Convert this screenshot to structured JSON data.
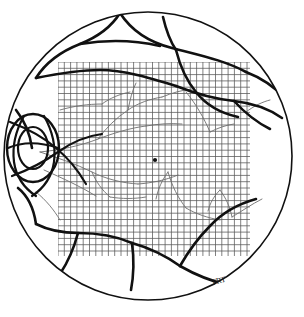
{
  "figure": {
    "background_color": "#ffffff",
    "ink_color": "#111111",
    "grid_color": "#555555",
    "fine_vessel_color": "#6e6e6e",
    "width": 304,
    "height": 317
  },
  "fundus_circle": {
    "label": "fundus-outline",
    "center_x": 148,
    "center_y": 156,
    "radius": 144,
    "stroke_width": 1.6
  },
  "optic_disc": {
    "label": "optic-disc",
    "center_x": 33,
    "center_y": 148,
    "radius_x": 26,
    "radius_y": 34,
    "inner_radius_x": 15,
    "inner_radius_y": 21
  },
  "fovea_marker": {
    "label": "fovea-center-dot",
    "x": 155,
    "y": 160,
    "radius": 2.1
  },
  "grid": {
    "label": "macular-grid",
    "left": 58,
    "top": 62,
    "right": 250,
    "bottom": 256,
    "cell_size": 6.3,
    "columns": 30,
    "rows": 31,
    "line_width": 0.75,
    "color": "#555555"
  },
  "signature": {
    "label": "artist-initials",
    "text": "TRT",
    "x": 212,
    "y": 285,
    "rotation": -14
  },
  "annotations": {
    "thick_vessel_count": 18,
    "fine_vessel_count": 22,
    "note": "Hand-drawn retinal fundus chart; heavy ink lines denote major retinal vessels and lesion borders, light gray lines denote fine vessel branches, square grid marks the posterior pole."
  },
  "vessels_thick": [
    "M 120 13 C 112 26 100 36 80 44 C 62 51 46 62 36 78",
    "M 120 13 C 131 30 148 42 172 48 C 198 55 224 60 246 72",
    "M 163 17 C 166 30 170 41 176 50",
    "M 80 44 C 104 40 134 40 160 46",
    "M 36 78 C 56 74 78 70 100 70 C 124 70 150 78 176 86",
    "M 176 50 C 180 66 186 80 196 92 C 206 105 220 113 238 117",
    "M 176 86 C 194 93 214 99 234 101 C 252 103 268 108 282 118",
    "M 246 72 C 262 78 276 88 287 100",
    "M 234 101 C 244 112 256 122 270 129",
    "M 16 110 C 24 120 30 134 32 148",
    "M 18 188 C 28 196 34 210 36 224",
    "M 36 224 C 48 230 62 233 78 233 C 96 233 116 236 132 243",
    "M 132 243 C 150 248 166 256 180 266",
    "M 180 266 C 194 274 210 281 228 285",
    "M 228 285 C 242 282 254 275 264 265",
    "M 132 243 C 134 258 134 274 131 290",
    "M 78 233 C 74 248 68 262 60 274",
    "M 180 266 C 188 252 198 238 210 226 C 222 213 238 204 256 199"
  ],
  "vessels_fine": [
    "M 40 152 C 60 150 80 146 98 139 C 114 133 130 128 146 126",
    "M 98 139 C 106 128 116 118 128 110 C 138 103 150 99 162 97",
    "M 128 110 C 130 100 132 91 136 83",
    "M 146 126 C 158 124 170 123 182 124",
    "M 40 152 C 58 158 76 164 92 172 C 106 179 122 183 138 184",
    "M 92 172 C 96 182 102 190 110 197",
    "M 138 184 C 152 183 166 180 178 175",
    "M 44 170 C 62 178 80 186 96 196",
    "M 162 97 C 172 93 182 90 192 89",
    "M 168 172 C 172 186 178 198 186 208",
    "M 168 172 C 162 180 158 189 156 199",
    "M 186 208 C 196 214 208 218 220 220",
    "M 220 190 C 226 198 230 207 232 217",
    "M 220 190 C 214 196 210 203 208 211",
    "M 232 217 C 242 211 252 204 262 199",
    "M 186 92 C 196 104 204 118 210 132",
    "M 210 132 C 218 128 226 125 234 124",
    "M 60 110 C 74 106 88 104 102 104",
    "M 102 104 C 110 98 120 94 130 92",
    "M 246 112 C 254 106 262 102 270 100",
    "M 110 197 C 122 199 134 199 146 197",
    "M 36 192 C 46 200 54 210 60 220"
  ]
}
